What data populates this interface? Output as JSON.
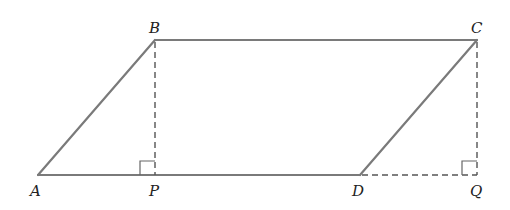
{
  "diagram": {
    "colors": {
      "solid_line": "#7a7a7a",
      "dashed_line": "#555555",
      "right_angle_marker": "#666666",
      "label": "#222222",
      "background": "#ffffff"
    },
    "points": {
      "A": {
        "label": "A",
        "x": 38,
        "y": 175
      },
      "B": {
        "label": "B",
        "x": 155,
        "y": 40
      },
      "C": {
        "label": "C",
        "x": 477,
        "y": 40
      },
      "D": {
        "label": "D",
        "x": 360,
        "y": 175
      },
      "P": {
        "label": "P",
        "x": 155,
        "y": 175
      },
      "Q": {
        "label": "Q",
        "x": 477,
        "y": 175
      }
    },
    "solid_segments": [
      "AB",
      "BC",
      "CD",
      "AD"
    ],
    "dashed_segments": [
      "BP",
      "CQ",
      "DQ"
    ],
    "right_angles": [
      "P",
      "Q"
    ]
  }
}
